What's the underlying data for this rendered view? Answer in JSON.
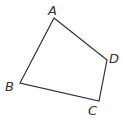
{
  "diagram": {
    "type": "quadrilateral",
    "stroke_color": "#333333",
    "vertices": [
      {
        "label": "A",
        "x": 54,
        "y": 18,
        "lx": 48,
        "ly": 15
      },
      {
        "label": "D",
        "x": 107,
        "y": 60,
        "lx": 109,
        "ly": 63
      },
      {
        "label": "C",
        "x": 99,
        "y": 101,
        "lx": 88,
        "ly": 115
      },
      {
        "label": "B",
        "x": 20,
        "y": 83,
        "lx": 5,
        "ly": 91
      }
    ],
    "labels": {
      "a": "A",
      "b": "B",
      "c": "C",
      "d": "D"
    }
  }
}
